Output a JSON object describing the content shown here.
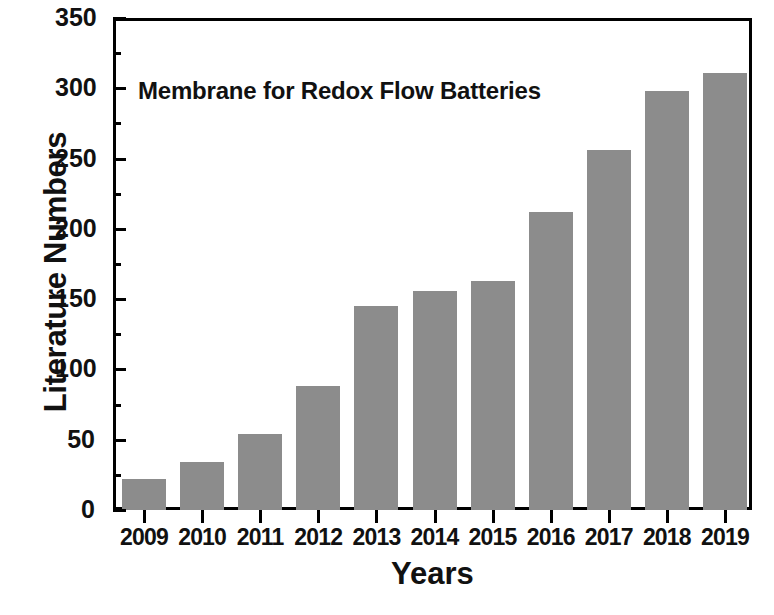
{
  "chart_data": {
    "type": "bar",
    "title": "",
    "annotation": "Membrane for Redox Flow Batteries",
    "categories": [
      "2009",
      "2010",
      "2011",
      "2012",
      "2013",
      "2014",
      "2015",
      "2016",
      "2017",
      "2018",
      "2019"
    ],
    "values": [
      22,
      34,
      54,
      88,
      145,
      156,
      163,
      212,
      256,
      298,
      311
    ],
    "xlabel": "Years",
    "ylabel": "Literature Numbers",
    "ylim": [
      0,
      350
    ],
    "ytick_labels": [
      "0",
      "50",
      "100",
      "150",
      "200",
      "250",
      "300",
      "350"
    ],
    "ytick_values": [
      0,
      50,
      100,
      150,
      200,
      250,
      300,
      350
    ],
    "yminor_values": [
      25,
      75,
      125,
      175,
      225,
      275,
      325
    ],
    "grid": false,
    "legend": false,
    "series": [
      {
        "name": "Literature Numbers",
        "values": [
          22,
          34,
          54,
          88,
          145,
          156,
          163,
          212,
          256,
          298,
          311
        ]
      }
    ]
  },
  "style": {
    "bar_color": "#8c8c8c",
    "axis_color": "#000000",
    "text_color": "#111111",
    "background": "#ffffff"
  }
}
